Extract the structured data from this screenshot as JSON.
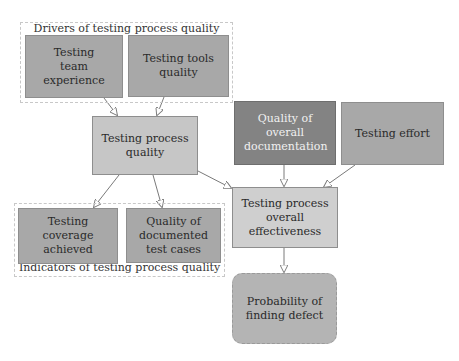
{
  "groups": {
    "drivers": {
      "label": "Drivers of testing process quality"
    },
    "indicators": {
      "label": "Indicators of testing process quality"
    }
  },
  "nodes": {
    "team_experience": {
      "label": "Testing team experience"
    },
    "tools_quality": {
      "label": "Testing tools quality"
    },
    "process_quality": {
      "label": "Testing process quality"
    },
    "documentation_quality": {
      "label": "Quality of overall documentation"
    },
    "testing_effort": {
      "label": "Testing effort"
    },
    "coverage_achieved": {
      "label": "Testing coverage achieved"
    },
    "documented_test_cases": {
      "label": "Quality of documented test cases"
    },
    "overall_effectiveness": {
      "label": "Testing process overall effectiveness"
    },
    "probability_defect": {
      "label": "Probability of finding defect"
    }
  },
  "edges": [
    {
      "from": "Testing team experience",
      "to": "Testing process quality"
    },
    {
      "from": "Testing tools quality",
      "to": "Testing process quality"
    },
    {
      "from": "Testing process quality",
      "to": "Testing coverage achieved"
    },
    {
      "from": "Testing process quality",
      "to": "Quality of documented test cases"
    },
    {
      "from": "Testing process quality",
      "to": "Testing process overall effectiveness"
    },
    {
      "from": "Quality of overall documentation",
      "to": "Testing process overall effectiveness"
    },
    {
      "from": "Testing effort",
      "to": "Testing process overall effectiveness"
    },
    {
      "from": "Testing process overall effectiveness",
      "to": "Probability of finding defect"
    }
  ],
  "colors": {
    "dark_node": "#838383",
    "mid_node": "#a8a8a8",
    "light_node": "#c6c6c6",
    "edge": "#7a7a7a",
    "group_border": "#c8c8c8"
  }
}
